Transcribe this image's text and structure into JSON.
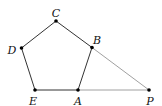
{
  "diagram": {
    "type": "geometry",
    "points": [
      {
        "id": "A",
        "label": "A",
        "x": 78,
        "y": 90,
        "lx": 78,
        "ly": 102
      },
      {
        "id": "B",
        "label": "B",
        "x": 92,
        "y": 47.5,
        "lx": 97,
        "ly": 41
      },
      {
        "id": "C",
        "label": "C",
        "x": 56,
        "y": 21,
        "lx": 56,
        "ly": 14
      },
      {
        "id": "D",
        "label": "D",
        "x": 21.5,
        "y": 48,
        "lx": 12,
        "ly": 51
      },
      {
        "id": "E",
        "label": "E",
        "x": 35,
        "y": 90,
        "lx": 33,
        "ly": 102
      },
      {
        "id": "P",
        "label": "P",
        "x": 149,
        "y": 90,
        "lx": 150,
        "ly": 102
      }
    ],
    "polygon": [
      "A",
      "B",
      "C",
      "D",
      "E"
    ],
    "segments": [
      {
        "from": "B",
        "to": "P"
      },
      {
        "from": "A",
        "to": "P"
      }
    ],
    "colors": {
      "edge": "#333333",
      "aux": "#888888",
      "point": "#000000"
    }
  }
}
